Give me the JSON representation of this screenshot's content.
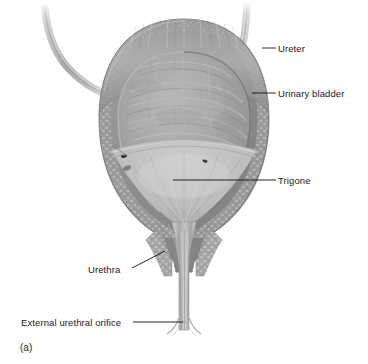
{
  "figure": {
    "caption": "(a)"
  },
  "labels": [
    {
      "id": "ureter",
      "text": "Ureter",
      "text_x": 278,
      "text_y": 44,
      "leader": "M 262 48 L 276 48"
    },
    {
      "id": "urinary-bladder",
      "text": "Urinary bladder",
      "text_x": 278,
      "text_y": 89,
      "leader": "M 252 93 L 276 93"
    },
    {
      "id": "trigone",
      "text": "Trigone",
      "text_x": 278,
      "text_y": 176,
      "leader": "M 173 180 L 276 180"
    },
    {
      "id": "urethra",
      "text": "Urethra",
      "text_x": 88,
      "text_y": 265,
      "leader": "M 132 268 L 165 251"
    },
    {
      "id": "external-urethral-orifice",
      "text": "External urethral orifice",
      "text_x": 21,
      "text_y": 318,
      "leader": "M 133 322 L 183 322"
    }
  ],
  "colors": {
    "wall_outer": "#8c8c8c",
    "wall_muscle": "#9a9a9a",
    "mucosa": "#adadad",
    "lumen_shadow": "#8f8f8f",
    "trigone": "#c2c2c2",
    "ureter_tube": "#b5b5b5",
    "urethra": "#bdbdbd",
    "leader_line": "#111111",
    "label_text": "#1a1a1a",
    "background": "#ffffff"
  },
  "structures": {
    "ureteric_orifices": 2,
    "ureters": 2,
    "trigone_shape": "triangular",
    "section_type": "frontal cut-away"
  }
}
